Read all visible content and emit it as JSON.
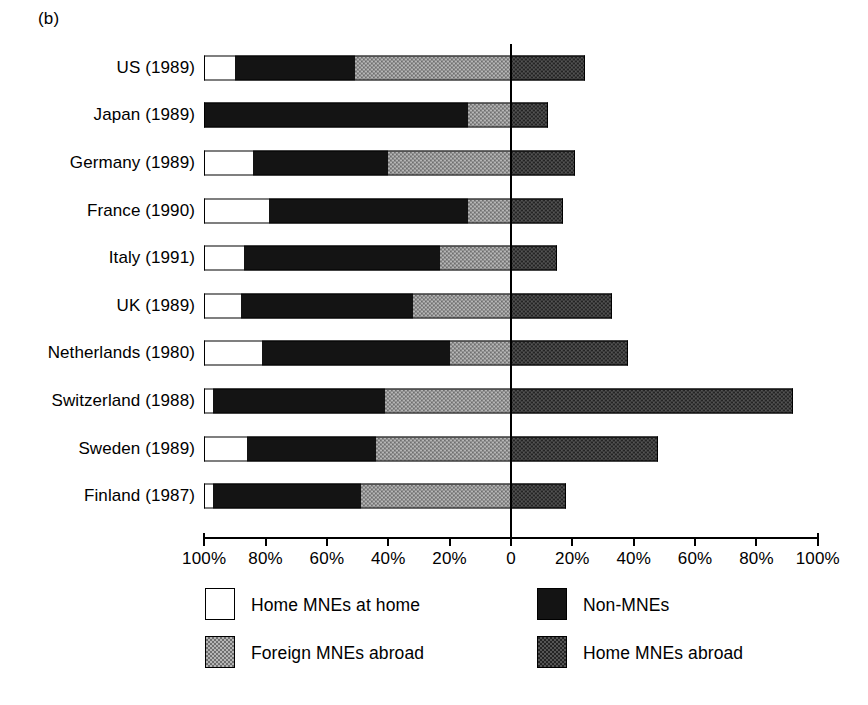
{
  "figure": {
    "panel_label": "(b)"
  },
  "axis": {
    "tick_labels": [
      "100%",
      "80%",
      "60%",
      "40%",
      "20%",
      "0",
      "20%",
      "40%",
      "60%",
      "80%",
      "100%"
    ],
    "tick_values": [
      -100,
      -80,
      -60,
      -40,
      -20,
      0,
      20,
      40,
      60,
      80,
      100
    ],
    "zero_label": "0"
  },
  "legend": {
    "items": [
      {
        "label": "Home MNEs at home",
        "key": "home_mnes_at_home",
        "fill": "white"
      },
      {
        "label": "Non-MNEs",
        "key": "non_mnes",
        "fill": "black"
      },
      {
        "label": "Foreign MNEs abroad",
        "key": "foreign_mnes_abroad",
        "fill": "light-checker"
      },
      {
        "label": "Home MNEs abroad",
        "key": "home_mnes_abroad",
        "fill": "dark-checker"
      }
    ]
  },
  "chart_data": {
    "type": "bar",
    "title": "",
    "subtitle": "",
    "orientation": "horizontal",
    "stacked": true,
    "diverging": true,
    "xlabel": "",
    "ylabel": "",
    "xlim": [
      -100,
      100
    ],
    "xticks": [
      -100,
      -80,
      -60,
      -40,
      -20,
      0,
      20,
      40,
      60,
      80,
      100
    ],
    "xtick_labels": [
      "100%",
      "80%",
      "60%",
      "40%",
      "20%",
      "0",
      "20%",
      "40%",
      "60%",
      "80%",
      "100%"
    ],
    "grid": false,
    "legend_position": "bottom",
    "categories": [
      "US (1989)",
      "Japan (1989)",
      "Germany (1989)",
      "France (1990)",
      "Italy (1991)",
      "UK (1989)",
      "Netherlands (1980)",
      "Switzerland (1988)",
      "Sweden (1989)",
      "Finland (1987)"
    ],
    "series": [
      {
        "name": "Home MNEs at home",
        "side": "left",
        "values": [
          10,
          0,
          16,
          21,
          13,
          12,
          19,
          3,
          14,
          3
        ]
      },
      {
        "name": "Non-MNEs",
        "side": "left",
        "values": [
          39,
          86,
          44,
          65,
          64,
          56,
          61,
          56,
          42,
          48
        ]
      },
      {
        "name": "Foreign MNEs abroad",
        "side": "left",
        "values": [
          51,
          14,
          40,
          14,
          23,
          32,
          20,
          41,
          44,
          49
        ]
      },
      {
        "name": "Home MNEs abroad",
        "side": "right",
        "values": [
          24,
          12,
          21,
          17,
          15,
          33,
          38,
          92,
          48,
          18
        ]
      }
    ]
  },
  "bars": [
    {
      "category": "US (1989)",
      "home_at_home": 10,
      "non_mnes": 39,
      "foreign_abroad": 51,
      "home_abroad": 24
    },
    {
      "category": "Japan (1989)",
      "home_at_home": 0,
      "non_mnes": 86,
      "foreign_abroad": 14,
      "home_abroad": 12
    },
    {
      "category": "Germany (1989)",
      "home_at_home": 16,
      "non_mnes": 44,
      "foreign_abroad": 40,
      "home_abroad": 21
    },
    {
      "category": "France (1990)",
      "home_at_home": 21,
      "non_mnes": 65,
      "foreign_abroad": 14,
      "home_abroad": 17
    },
    {
      "category": "Italy (1991)",
      "home_at_home": 13,
      "non_mnes": 64,
      "foreign_abroad": 23,
      "home_abroad": 15
    },
    {
      "category": "UK (1989)",
      "home_at_home": 12,
      "non_mnes": 56,
      "foreign_abroad": 32,
      "home_abroad": 33
    },
    {
      "category": "Netherlands (1980)",
      "home_at_home": 19,
      "non_mnes": 61,
      "foreign_abroad": 20,
      "home_abroad": 38
    },
    {
      "category": "Switzerland (1988)",
      "home_at_home": 3,
      "non_mnes": 56,
      "foreign_abroad": 41,
      "home_abroad": 92
    },
    {
      "category": "Sweden (1989)",
      "home_at_home": 14,
      "non_mnes": 42,
      "foreign_abroad": 44,
      "home_abroad": 48
    },
    {
      "category": "Finland (1987)",
      "home_at_home": 3,
      "non_mnes": 48,
      "foreign_abroad": 49,
      "home_abroad": 18
    }
  ]
}
